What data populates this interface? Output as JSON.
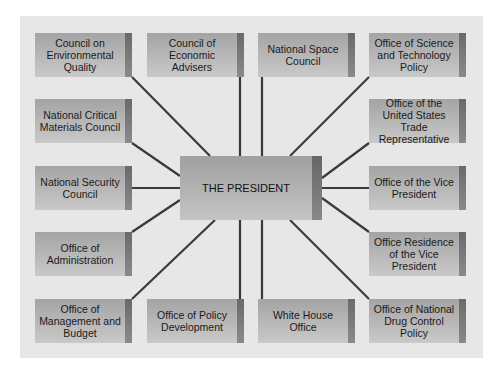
{
  "center": {
    "label": "THE PRESIDENT"
  },
  "offices": [
    {
      "label": "Council on Environmental Quality",
      "x": 35,
      "y": 33
    },
    {
      "label": "Council of Economic Advisers",
      "x": 147,
      "y": 33
    },
    {
      "label": "National Space Council",
      "x": 258,
      "y": 33
    },
    {
      "label": "Office of Science and Technology Policy",
      "x": 369,
      "y": 33
    },
    {
      "label": "National Critical Materials Council",
      "x": 35,
      "y": 99
    },
    {
      "label": "Office of the United States Trade Representative",
      "x": 369,
      "y": 99
    },
    {
      "label": "National Security Council",
      "x": 35,
      "y": 166
    },
    {
      "label": "Office of the Vice President",
      "x": 369,
      "y": 166
    },
    {
      "label": "Office of Administration",
      "x": 35,
      "y": 232
    },
    {
      "label": "Office Residence of the Vice President",
      "x": 369,
      "y": 232
    },
    {
      "label": "Office of Management and Budget",
      "x": 35,
      "y": 299
    },
    {
      "label": "Office of Policy Development",
      "x": 147,
      "y": 299
    },
    {
      "label": "White House Office",
      "x": 258,
      "y": 299
    },
    {
      "label": "Office of National Drug Control Policy",
      "x": 369,
      "y": 299
    }
  ],
  "colors": {
    "panel": "#e7e7e7",
    "line": "#3a3a3a",
    "box": "#b5b5b5"
  }
}
